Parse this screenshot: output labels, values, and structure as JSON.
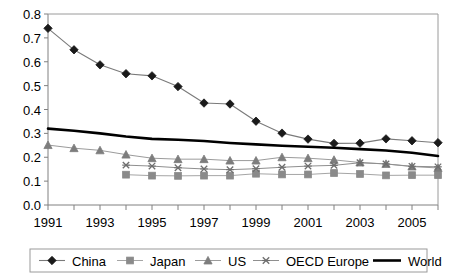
{
  "chart_data": {
    "type": "line",
    "title": "",
    "xlabel": "",
    "ylabel": "",
    "x": [
      1991,
      1992,
      1993,
      1994,
      1995,
      1996,
      1997,
      1998,
      1999,
      2000,
      2001,
      2002,
      2003,
      2004,
      2005,
      2006
    ],
    "xlim": [
      1991,
      2006
    ],
    "ylim": [
      0.0,
      0.8
    ],
    "ytick_labels": [
      "0.0",
      "0.1",
      "0.2",
      "0.3",
      "0.4",
      "0.5",
      "0.6",
      "0.7",
      "0.8"
    ],
    "ytick_values": [
      0.0,
      0.1,
      0.2,
      0.3,
      0.4,
      0.5,
      0.6,
      0.7,
      0.8
    ],
    "xtick_labels": [
      "1991",
      "",
      "1993",
      "",
      "1995",
      "",
      "1997",
      "",
      "1999",
      "",
      "2001",
      "",
      "2003",
      "",
      "2005",
      ""
    ],
    "xtick_values": [
      1991,
      1992,
      1993,
      1994,
      1995,
      1996,
      1997,
      1998,
      1999,
      2000,
      2001,
      2002,
      2003,
      2004,
      2005,
      2006
    ],
    "grid": false,
    "legend_position": "bottom",
    "series": [
      {
        "name": "China",
        "marker": "diamond",
        "color": "#1a1a1a",
        "line_color": "#7a7a7a",
        "line_width": 1.1,
        "values": [
          0.74,
          0.65,
          0.587,
          0.55,
          0.541,
          0.496,
          0.427,
          0.423,
          0.351,
          0.301,
          0.276,
          0.258,
          0.259,
          0.277,
          0.269,
          0.261
        ]
      },
      {
        "name": "Japan",
        "marker": "square",
        "color": "#8a8a8a",
        "line_color": "#a5a5a5",
        "line_width": 1.0,
        "values": [
          null,
          null,
          null,
          0.127,
          0.123,
          0.122,
          0.123,
          0.123,
          0.131,
          0.128,
          0.128,
          0.134,
          0.13,
          0.124,
          0.125,
          0.125
        ]
      },
      {
        "name": "US",
        "marker": "triangle",
        "color": "#7d7d7d",
        "line_color": "#9b9b9b",
        "line_width": 1.0,
        "values": [
          0.251,
          0.238,
          0.229,
          0.211,
          0.196,
          0.192,
          0.192,
          0.186,
          0.186,
          0.2,
          0.196,
          0.189,
          0.178,
          0.172,
          0.161,
          0.155
        ]
      },
      {
        "name": "OECD Europe",
        "marker": "x",
        "color": "#6e6e6e",
        "line_color": "#8f8f8f",
        "line_width": 1.0,
        "values": [
          null,
          null,
          null,
          0.167,
          0.163,
          0.156,
          0.151,
          0.148,
          0.152,
          0.158,
          0.163,
          0.166,
          0.177,
          0.172,
          0.162,
          0.16
        ]
      },
      {
        "name": "World",
        "marker": "none",
        "color": "#000000",
        "line_color": "#000000",
        "line_width": 2.6,
        "values": [
          0.32,
          0.311,
          0.3,
          0.287,
          0.277,
          0.273,
          0.268,
          0.26,
          0.254,
          0.248,
          0.244,
          0.24,
          0.234,
          0.228,
          0.219,
          0.205
        ]
      }
    ],
    "legend": [
      {
        "label": "China",
        "marker": "diamond"
      },
      {
        "label": "Japan",
        "marker": "square"
      },
      {
        "label": "US",
        "marker": "triangle"
      },
      {
        "label": "OECD Europe",
        "marker": "x"
      },
      {
        "label": "World",
        "marker": "none"
      }
    ],
    "colors": {
      "axis": "#808080",
      "plot_border": "#9a9a9a",
      "legend_border": "#9a9a9a",
      "background": "#ffffff",
      "world_line": "#000000",
      "china_marker": "#1a1a1a"
    }
  }
}
